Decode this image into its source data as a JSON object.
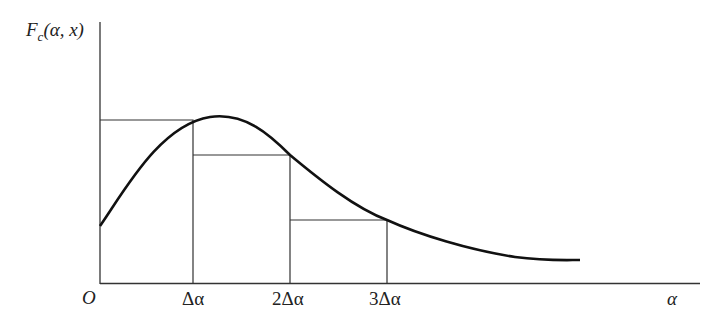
{
  "diagram": {
    "y_label": {
      "main": "F",
      "sub": "c",
      "args": "(α, x)"
    },
    "origin_label": "O",
    "x_axis_label": "α",
    "ticks": [
      "Δα",
      "2Δα",
      "3Δα"
    ],
    "colors": {
      "line": "#333333",
      "curve": "#111111"
    }
  }
}
